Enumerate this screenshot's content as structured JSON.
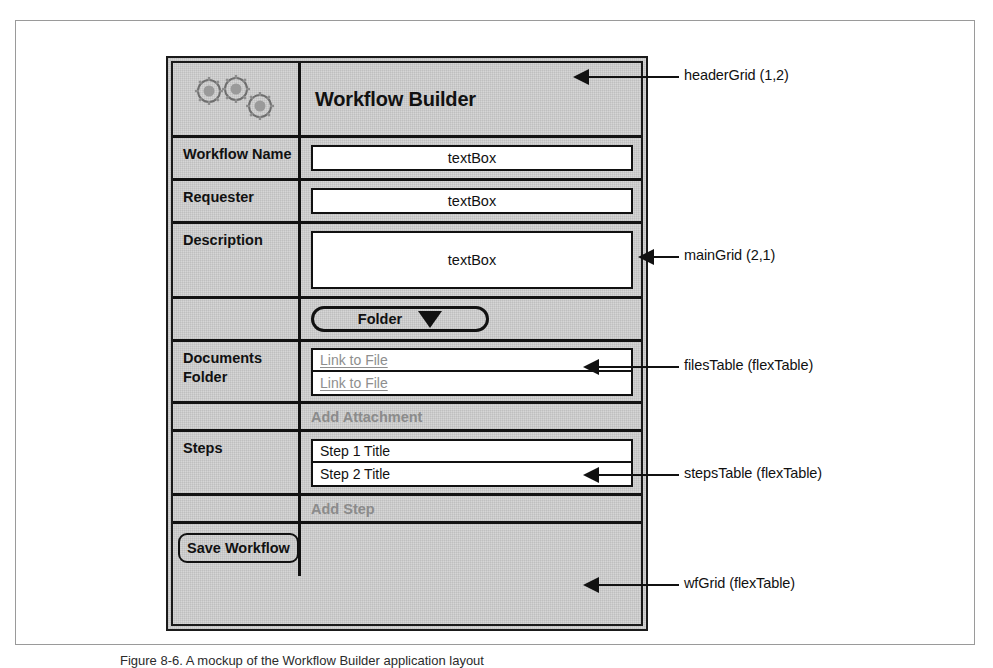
{
  "figure": {
    "caption": "Figure 8-6. A mockup of the Workflow Builder application layout"
  },
  "mockup": {
    "header": {
      "icon": "gears-icon",
      "title": "Workflow Builder"
    },
    "rows": [
      {
        "id": "row-name",
        "label": "Workflow Name",
        "field_kind": "textBox",
        "value": "textBox"
      },
      {
        "id": "row-req",
        "label": "Requester",
        "field_kind": "textBox",
        "value": "textBox"
      },
      {
        "id": "row-desc",
        "label": "Description",
        "field_kind": "textBox",
        "value": "textBox"
      },
      {
        "id": "row-folder",
        "label": "",
        "field_kind": "dropdown",
        "value": "Folder"
      },
      {
        "id": "row-docs",
        "label": "Documents Folder",
        "label_line1": "Documents",
        "label_line2": "Folder",
        "field_kind": "flexTable"
      },
      {
        "id": "row-addatt",
        "label": "",
        "field_kind": "action",
        "value": "Add Attachment"
      },
      {
        "id": "row-steps",
        "label": "Steps",
        "field_kind": "flexTable"
      },
      {
        "id": "row-addstep",
        "label": "",
        "field_kind": "action",
        "value": "Add Step"
      },
      {
        "id": "row-save",
        "label": "Save Workflow",
        "field_kind": "empty"
      }
    ],
    "files_table": {
      "rows": [
        {
          "text": "Link to File"
        },
        {
          "text": "Link to File"
        }
      ]
    },
    "steps_table": {
      "rows": [
        {
          "text": "Step 1 Title"
        },
        {
          "text": "Step 2 Title"
        }
      ]
    },
    "actions": {
      "add_attachment": "Add Attachment",
      "add_step": "Add Step",
      "save_workflow": "Save Workflow"
    },
    "dropdown": {
      "selected": "Folder",
      "caret": "chevron-down-icon"
    }
  },
  "annotations": [
    {
      "id": "anno-header",
      "text": "headerGrid (1,2)"
    },
    {
      "id": "anno-main",
      "text": "mainGrid (2,1)"
    },
    {
      "id": "anno-files",
      "text": "filesTable (flexTable)"
    },
    {
      "id": "anno-steps",
      "text": "stepsTable (flexTable)"
    },
    {
      "id": "anno-wf",
      "text": "wfGrid (flexTable)"
    }
  ],
  "colors": {
    "ink": "#111111",
    "panel_gray": "#d6d6d6",
    "muted_text": "#8b8b8b",
    "link_text": "#8e8e8e",
    "frame": "#9a9a9a"
  }
}
